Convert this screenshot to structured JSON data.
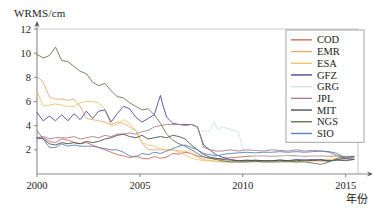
{
  "chart_data": {
    "type": "line",
    "title": "",
    "ylabel": "WRMS/cm",
    "xlabel": "年份",
    "xlim": [
      2000,
      2015.6
    ],
    "ylim": [
      0,
      12
    ],
    "xticks": [
      "2000",
      "2005",
      "2010",
      "2015"
    ],
    "xtick_values": [
      2000,
      2005,
      2010,
      2015
    ],
    "yticks": [
      "2",
      "4",
      "6",
      "8",
      "10",
      "12"
    ],
    "ytick_values": [
      2,
      4,
      6,
      8,
      10,
      12
    ],
    "grid": false,
    "legend_position": "upper-right",
    "legend_entries": [
      "COD",
      "EMR",
      "ESA",
      "GFZ",
      "GRG",
      "JPL",
      "MIT",
      "NGS",
      "SIO"
    ],
    "colors": {
      "COD": "#cf6a5e",
      "EMR": "#e8a87c",
      "ESA": "#e8c96a",
      "GFZ": "#4a4a9c",
      "GRG": "#cfe4ea",
      "JPL": "#a97f87",
      "MIT": "#4f4f4f",
      "NGS": "#5f7a4e",
      "SIO": "#5a82b8"
    },
    "series": [
      {
        "name": "COD",
        "color": "#cf6a5e",
        "x": [
          2000.0,
          2000.3,
          2000.6,
          2000.9,
          2001.2,
          2001.5,
          2001.8,
          2002.1,
          2002.4,
          2002.7,
          2003.0,
          2003.3,
          2003.6,
          2003.9,
          2004.2,
          2004.5,
          2004.8,
          2005.1,
          2005.4,
          2005.7,
          2006.0,
          2006.3,
          2006.6,
          2006.9,
          2007.2,
          2007.5,
          2007.8,
          2008.1,
          2008.4,
          2008.7,
          2009.0,
          2009.4,
          2009.8,
          2010.2,
          2010.6,
          2011.0,
          2011.4,
          2011.8,
          2012.2,
          2012.6,
          2013.0,
          2013.4,
          2013.8,
          2014.2,
          2014.6,
          2015.0,
          2015.4
        ],
        "y": [
          2.9,
          3.0,
          2.7,
          2.6,
          2.9,
          2.8,
          2.6,
          2.5,
          2.6,
          2.4,
          2.2,
          2.0,
          1.8,
          1.6,
          1.5,
          1.35,
          1.5,
          1.3,
          1.25,
          1.45,
          1.3,
          1.4,
          1.7,
          1.65,
          1.8,
          1.7,
          1.5,
          1.4,
          1.3,
          1.25,
          1.3,
          1.35,
          1.4,
          1.45,
          1.5,
          1.5,
          1.45,
          1.5,
          1.55,
          1.5,
          1.45,
          1.5,
          1.5,
          1.45,
          1.5,
          1.4,
          1.45
        ]
      },
      {
        "name": "EMR",
        "color": "#e8a87c",
        "x": [
          2000.0,
          2000.3,
          2000.6,
          2000.9,
          2001.2,
          2001.5,
          2001.8,
          2002.1,
          2002.4,
          2002.7,
          2003.0,
          2003.3,
          2003.6,
          2003.9,
          2004.2,
          2004.5,
          2004.8,
          2005.1,
          2005.4,
          2005.7,
          2006.0,
          2006.3,
          2006.6,
          2006.9,
          2007.2,
          2007.5,
          2007.8,
          2008.1,
          2008.4,
          2008.7,
          2009.0,
          2009.4,
          2009.8,
          2010.2,
          2010.6,
          2011.0,
          2011.4,
          2011.8,
          2012.2,
          2012.6,
          2013.0,
          2013.4,
          2013.8,
          2014.2,
          2014.6,
          2015.0,
          2015.4
        ],
        "y": [
          8.1,
          7.6,
          6.4,
          6.2,
          6.2,
          6.1,
          6.2,
          5.6,
          4.6,
          4.5,
          4.4,
          4.3,
          4.1,
          4.3,
          4.2,
          3.9,
          3.6,
          2.6,
          2.0,
          2.0,
          2.0,
          2.0,
          2.0,
          1.9,
          1.9,
          1.7,
          1.4,
          1.2,
          1.1,
          1.05,
          1.0,
          1.0,
          1.0,
          1.0,
          1.05,
          1.0,
          1.0,
          1.05,
          1.0,
          1.0,
          1.05,
          1.1,
          1.05,
          1.1,
          1.15,
          1.2,
          1.25
        ]
      },
      {
        "name": "ESA",
        "color": "#e8c96a",
        "x": [
          2000.0,
          2000.3,
          2000.6,
          2000.9,
          2001.2,
          2001.5,
          2001.8,
          2002.1,
          2002.4,
          2002.7,
          2003.0,
          2003.3,
          2003.6,
          2003.9,
          2004.2,
          2004.5,
          2004.8,
          2005.1,
          2005.4,
          2005.7,
          2006.0,
          2006.3,
          2006.6,
          2006.9,
          2007.2,
          2007.5,
          2007.8,
          2008.1,
          2008.4,
          2008.7,
          2009.0,
          2009.4,
          2009.8,
          2010.2,
          2010.6,
          2011.0,
          2011.4,
          2011.8,
          2012.2,
          2012.6,
          2013.0,
          2013.4,
          2013.8,
          2014.2,
          2014.6,
          2015.0,
          2015.4
        ],
        "y": [
          6.9,
          5.6,
          5.7,
          5.8,
          5.7,
          5.6,
          5.6,
          5.9,
          6.0,
          6.0,
          5.9,
          5.4,
          4.0,
          4.1,
          4.5,
          4.2,
          3.6,
          2.6,
          2.4,
          2.3,
          2.1,
          2.0,
          2.0,
          1.8,
          1.6,
          1.3,
          1.2,
          1.1,
          1.1,
          1.05,
          1.0,
          1.0,
          1.0,
          1.0,
          1.0,
          1.0,
          1.0,
          1.05,
          1.0,
          1.0,
          1.05,
          1.1,
          1.1,
          1.2,
          1.3,
          1.35,
          1.4
        ]
      },
      {
        "name": "GFZ",
        "color": "#4a4a9c",
        "x": [
          2000.0,
          2000.3,
          2000.6,
          2000.9,
          2001.2,
          2001.5,
          2001.8,
          2002.1,
          2002.4,
          2002.7,
          2003.0,
          2003.3,
          2003.6,
          2003.9,
          2004.2,
          2004.5,
          2004.8,
          2005.1,
          2005.4,
          2005.7,
          2005.9,
          2006.0,
          2006.1,
          2006.3,
          2006.6,
          2006.9,
          2007.2,
          2007.5,
          2007.8,
          2008.1,
          2008.4,
          2008.7,
          2009.0,
          2009.4,
          2009.8,
          2010.2,
          2010.6,
          2011.0,
          2011.4,
          2011.8,
          2012.2,
          2012.6,
          2013.0,
          2013.4,
          2013.8,
          2014.2,
          2014.6,
          2015.0,
          2015.4
        ],
        "y": [
          5.1,
          4.4,
          4.8,
          4.4,
          4.9,
          4.4,
          5.0,
          4.5,
          5.2,
          4.6,
          5.2,
          5.3,
          4.3,
          5.0,
          5.6,
          5.4,
          4.7,
          4.3,
          4.6,
          4.9,
          6.0,
          6.5,
          5.8,
          4.7,
          4.2,
          4.1,
          4.1,
          4.1,
          3.9,
          2.4,
          2.0,
          1.6,
          1.4,
          1.2,
          1.1,
          1.15,
          1.1,
          1.1,
          1.1,
          1.15,
          1.1,
          1.2,
          1.15,
          1.2,
          1.15,
          1.05,
          1.2,
          1.3,
          1.2
        ]
      },
      {
        "name": "GRG",
        "color": "#cfe4ea",
        "x": [
          2008.0,
          2008.2,
          2008.4,
          2008.6,
          2008.8,
          2009.0,
          2009.2,
          2009.4,
          2009.6,
          2009.8,
          2010.0,
          2010.2,
          2010.4,
          2010.6,
          2011.0,
          2011.4,
          2011.8,
          2012.2,
          2012.6,
          2013.0,
          2013.4,
          2013.8,
          2014.2,
          2014.6,
          2015.0,
          2015.4
        ],
        "y": [
          3.5,
          3.6,
          3.5,
          4.3,
          3.7,
          3.9,
          3.8,
          3.7,
          3.6,
          3.5,
          2.0,
          1.6,
          1.5,
          1.5,
          1.5,
          1.5,
          1.5,
          1.5,
          1.45,
          1.5,
          1.5,
          1.5,
          1.5,
          1.6,
          1.5,
          1.5
        ]
      },
      {
        "name": "JPL",
        "color": "#a97f87",
        "x": [
          2000.0,
          2000.3,
          2000.6,
          2000.9,
          2001.2,
          2001.5,
          2001.8,
          2002.1,
          2002.4,
          2002.7,
          2003.0,
          2003.3,
          2003.6,
          2003.9,
          2004.2,
          2004.5,
          2004.8,
          2005.1,
          2005.4,
          2005.7,
          2006.0,
          2006.3,
          2006.6,
          2006.9,
          2007.2,
          2007.5,
          2007.8,
          2008.1,
          2008.4,
          2008.7,
          2009.0,
          2009.4,
          2009.8,
          2010.2,
          2010.6,
          2011.0,
          2011.4,
          2011.8,
          2012.2,
          2012.6,
          2013.0,
          2013.4,
          2013.8,
          2014.2,
          2014.6,
          2015.0,
          2015.4
        ],
        "y": [
          3.0,
          3.1,
          2.9,
          3.0,
          3.0,
          3.0,
          3.1,
          2.9,
          3.0,
          3.1,
          3.0,
          3.2,
          3.1,
          3.3,
          3.3,
          3.4,
          3.3,
          3.5,
          3.6,
          3.9,
          4.0,
          4.1,
          4.1,
          4.1,
          4.0,
          4.1,
          3.9,
          2.2,
          2.0,
          1.9,
          1.9,
          2.0,
          1.9,
          2.0,
          1.95,
          1.9,
          2.0,
          1.95,
          1.9,
          2.0,
          1.9,
          1.95,
          1.9,
          1.8,
          1.5,
          1.4,
          1.45
        ]
      },
      {
        "name": "MIT",
        "color": "#4f4f4f",
        "x": [
          2000.0,
          2000.3,
          2000.6,
          2000.9,
          2001.2,
          2001.5,
          2001.8,
          2002.1,
          2002.4,
          2002.7,
          2003.0,
          2003.3,
          2003.6,
          2003.9,
          2004.2,
          2004.5,
          2004.8,
          2005.1,
          2005.4,
          2005.7,
          2006.0,
          2006.3,
          2006.6,
          2006.9,
          2007.2,
          2007.5,
          2007.8,
          2008.1,
          2008.4,
          2008.7,
          2009.0,
          2009.4,
          2009.8,
          2010.2,
          2010.6,
          2011.0,
          2011.4,
          2011.8,
          2012.2,
          2012.6,
          2013.0,
          2013.4,
          2013.8,
          2014.2,
          2014.6,
          2015.0,
          2015.4
        ],
        "y": [
          3.0,
          2.9,
          2.5,
          2.4,
          2.6,
          2.5,
          2.6,
          2.5,
          2.7,
          2.6,
          2.7,
          2.9,
          3.0,
          3.2,
          3.3,
          3.1,
          3.0,
          3.2,
          2.9,
          3.0,
          3.1,
          3.0,
          3.2,
          3.1,
          2.9,
          2.4,
          2.0,
          1.6,
          1.4,
          1.3,
          1.2,
          1.15,
          1.1,
          1.1,
          1.15,
          1.1,
          1.1,
          1.15,
          1.1,
          1.1,
          1.15,
          1.1,
          1.2,
          1.1,
          1.15,
          1.1,
          1.2
        ]
      },
      {
        "name": "NGS",
        "color": "#5f7a4e",
        "x": [
          2000.0,
          2000.3,
          2000.6,
          2000.9,
          2001.2,
          2001.5,
          2001.8,
          2002.1,
          2002.4,
          2002.7,
          2003.0,
          2003.3,
          2003.6,
          2003.9,
          2004.2,
          2004.5,
          2004.8,
          2005.1,
          2005.4,
          2005.7,
          2006.0,
          2006.3,
          2006.6,
          2006.9,
          2007.2,
          2007.5,
          2007.8,
          2008.1,
          2008.4,
          2008.7,
          2009.0,
          2009.4,
          2009.8,
          2010.2,
          2010.6,
          2011.0,
          2011.4,
          2011.8,
          2012.2,
          2012.6,
          2013.0,
          2013.4,
          2013.8,
          2014.2,
          2014.6,
          2015.0,
          2015.4
        ],
        "y": [
          9.9,
          9.6,
          9.8,
          10.5,
          9.4,
          9.3,
          8.9,
          8.5,
          8.3,
          7.6,
          7.3,
          7.5,
          6.9,
          6.4,
          6.3,
          5.9,
          5.6,
          5.3,
          5.4,
          4.9,
          4.2,
          3.3,
          2.8,
          2.5,
          2.3,
          2.0,
          1.7,
          1.4,
          1.3,
          1.2,
          1.1,
          1.0,
          1.0,
          1.0,
          1.05,
          1.0,
          1.0,
          1.0,
          1.05,
          1.0,
          1.0,
          0.9,
          0.8,
          1.0,
          1.3,
          1.4,
          1.45
        ]
      },
      {
        "name": "SIO",
        "color": "#5a82b8",
        "x": [
          2000.0,
          2000.3,
          2000.6,
          2000.9,
          2001.2,
          2001.5,
          2001.8,
          2002.1,
          2002.4,
          2002.7,
          2003.0,
          2003.3,
          2003.6,
          2003.9,
          2004.2,
          2004.5,
          2004.8,
          2005.1,
          2005.4,
          2005.7,
          2006.0,
          2006.3,
          2006.6,
          2006.9,
          2007.2,
          2007.5,
          2007.8,
          2008.1,
          2008.4,
          2008.7,
          2009.0,
          2009.4,
          2009.8,
          2010.2,
          2010.6,
          2011.0,
          2011.4,
          2011.8,
          2012.2,
          2012.6,
          2013.0,
          2013.4,
          2013.8,
          2014.2,
          2014.6,
          2015.0,
          2015.4
        ],
        "y": [
          3.6,
          2.9,
          2.2,
          2.2,
          2.5,
          2.3,
          2.4,
          2.3,
          2.3,
          2.3,
          2.2,
          2.1,
          2.0,
          2.0,
          1.8,
          1.5,
          1.4,
          1.7,
          1.6,
          1.8,
          1.7,
          1.9,
          2.1,
          2.3,
          2.4,
          2.2,
          2.0,
          1.7,
          1.6,
          1.5,
          1.6,
          1.7,
          1.75,
          1.8,
          1.75,
          1.8,
          1.8,
          1.85,
          1.8,
          1.85,
          1.8,
          1.85,
          1.9,
          1.85,
          1.7,
          1.3,
          1.35
        ]
      }
    ]
  }
}
